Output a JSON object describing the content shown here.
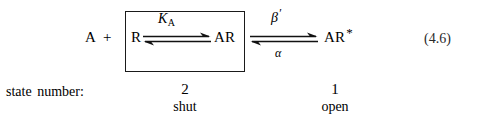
{
  "equation": {
    "number": "(4.6)",
    "scheme": {
      "agonist": "A",
      "plus": "+",
      "receptor": "R",
      "bound_receptor": "AR",
      "open_receptor": "AR",
      "open_receptor_superscript": "*",
      "forward_constant": "K",
      "forward_constant_subscript": "A",
      "opening_rate": "β",
      "opening_rate_prime": "′",
      "closing_rate": "α",
      "boxed_region_label": "shut-state-box"
    }
  },
  "state_row": {
    "label": "state number:",
    "states": [
      {
        "number": "2",
        "name": "shut"
      },
      {
        "number": "1",
        "name": "open"
      }
    ]
  },
  "icons": {
    "equilibrium_arrow": "reversible-harpoon-arrow"
  },
  "colors": {
    "text": "#000000",
    "box_stroke": "#1a1a1a",
    "equation_number": "#2a2a2a",
    "background": "#ffffff"
  }
}
